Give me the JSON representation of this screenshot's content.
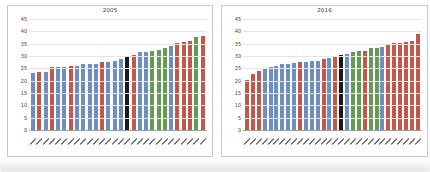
{
  "palette": {
    "blue": "#6e8ec1",
    "red": "#c2584c",
    "green": "#649a51",
    "black": "#1a1a1a"
  },
  "axis_style": {
    "gridline_color": "#e4e4e4",
    "baseline_color": "#9f9f9f",
    "tick_text_color": "#3f3f3f"
  },
  "x_axis_note": "rotated tick labels, illegible at source resolution",
  "chart_data": [
    {
      "type": "bar",
      "title": "2005",
      "xlabel": "",
      "ylabel": "",
      "ylim": [
        0,
        45
      ],
      "yticks": [
        0,
        5,
        10,
        15,
        20,
        25,
        30,
        35,
        40,
        45
      ],
      "grid": true,
      "legend": "none",
      "values": [
        23.5,
        24,
        24,
        26,
        26,
        26,
        26.5,
        26.5,
        27,
        27,
        27.2,
        27.8,
        28,
        28.2,
        29,
        30.5,
        31,
        32,
        32.2,
        32.5,
        33,
        33.5,
        34.5,
        35.8,
        36.2,
        36.5,
        38,
        38.5
      ],
      "bar_colors": [
        "blue",
        "red",
        "blue",
        "red",
        "blue",
        "blue",
        "red",
        "blue",
        "blue",
        "blue",
        "blue",
        "red",
        "blue",
        "blue",
        "blue",
        "black",
        "red",
        "blue",
        "blue",
        "green",
        "green",
        "green",
        "blue",
        "red",
        "red",
        "red",
        "green",
        "red"
      ]
    },
    {
      "type": "bar",
      "title": "2016",
      "xlabel": "",
      "ylabel": "",
      "ylim": [
        0,
        45
      ],
      "yticks": [
        0,
        5,
        10,
        15,
        20,
        25,
        30,
        35,
        40,
        45
      ],
      "grid": true,
      "legend": "none",
      "values": [
        20.5,
        23,
        24.5,
        25.5,
        26,
        26.5,
        27,
        27,
        27.5,
        28,
        28,
        28.2,
        28.5,
        29,
        29.5,
        30.5,
        31,
        31.2,
        32,
        32.5,
        32.5,
        33.5,
        33.5,
        34,
        35,
        35.5,
        35.5,
        36,
        36.5,
        39.5
      ],
      "bar_colors": [
        "red",
        "red",
        "red",
        "blue",
        "blue",
        "blue",
        "blue",
        "blue",
        "blue",
        "red",
        "blue",
        "blue",
        "blue",
        "red",
        "blue",
        "red",
        "black",
        "blue",
        "green",
        "green",
        "red",
        "green",
        "green",
        "blue",
        "red",
        "red",
        "red",
        "red",
        "red",
        "red"
      ]
    }
  ]
}
